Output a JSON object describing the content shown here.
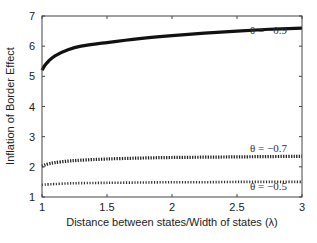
{
  "chart_data": {
    "type": "line",
    "title": "",
    "xlabel": "Distance between states/Width of states (λ)",
    "ylabel": "Inflation of Border Effect",
    "xlim": [
      1,
      3
    ],
    "ylim": [
      1,
      7
    ],
    "xticks": [
      1,
      1.5,
      2,
      2.5,
      3
    ],
    "xtick_labels": [
      "1",
      "1.5",
      "2",
      "2.5",
      "3"
    ],
    "yticks": [
      1,
      2,
      3,
      4,
      5,
      6,
      7
    ],
    "ytick_labels": [
      "1",
      "2",
      "3",
      "4",
      "5",
      "6",
      "7"
    ],
    "grid": false,
    "legend": "inline annotations",
    "x": [
      1.0,
      1.02,
      1.05,
      1.1,
      1.2,
      1.3,
      1.5,
      1.75,
      2.0,
      2.25,
      2.5,
      2.75,
      3.0
    ],
    "series": [
      {
        "name": "θ = −0.9",
        "style": "solid-thick",
        "values": [
          5.2,
          5.35,
          5.5,
          5.68,
          5.88,
          6.0,
          6.12,
          6.25,
          6.35,
          6.43,
          6.5,
          6.56,
          6.6
        ]
      },
      {
        "name": "θ = −0.7",
        "style": "dotted-thick",
        "values": [
          2.02,
          2.06,
          2.1,
          2.14,
          2.19,
          2.22,
          2.26,
          2.29,
          2.31,
          2.32,
          2.33,
          2.34,
          2.35
        ]
      },
      {
        "name": "θ = −0.5",
        "style": "dotted",
        "values": [
          1.4,
          1.41,
          1.42,
          1.43,
          1.45,
          1.46,
          1.47,
          1.48,
          1.49,
          1.49,
          1.5,
          1.5,
          1.5
        ]
      }
    ],
    "annotations": [
      {
        "text": "θ = −0.9",
        "x": 2.6,
        "y": 6.4
      },
      {
        "text": "θ = −0.7",
        "x": 2.6,
        "y": 2.5
      },
      {
        "text": "θ = −0.5",
        "x": 2.6,
        "y": 1.23
      }
    ]
  }
}
